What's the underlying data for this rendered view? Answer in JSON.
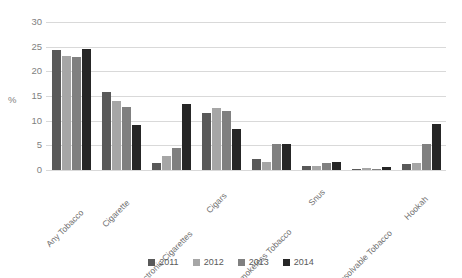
{
  "chart_data": {
    "type": "bar",
    "title": "",
    "xlabel": "",
    "ylabel": "%",
    "ylim": [
      0,
      30
    ],
    "yticks": [
      0,
      5,
      10,
      15,
      20,
      25,
      30
    ],
    "grid": true,
    "legend_position": "bottom",
    "categories": [
      "Any Tobacco",
      "Cigarette",
      "Electronic Cigarettes",
      "Cigars",
      "Smokeless Tobacco",
      "Snus",
      "Dissolvable Tobacco",
      "Hookah"
    ],
    "series": [
      {
        "name": "2011",
        "color": "#595959",
        "values": [
          24.3,
          15.8,
          1.5,
          11.6,
          2.2,
          0.9,
          0.3,
          1.3
        ]
      },
      {
        "name": "2012",
        "color": "#a6a6a6",
        "values": [
          23.2,
          14.0,
          2.8,
          12.6,
          1.7,
          0.8,
          0.4,
          1.5
        ]
      },
      {
        "name": "2013",
        "color": "#808080",
        "values": [
          22.9,
          12.7,
          4.5,
          11.9,
          5.3,
          1.4,
          0.3,
          5.2
        ]
      },
      {
        "name": "2014",
        "color": "#262626",
        "values": [
          24.6,
          9.2,
          13.4,
          8.3,
          5.3,
          1.6,
          0.6,
          9.4
        ]
      }
    ]
  },
  "axis": {
    "y_axis_title": "%"
  }
}
